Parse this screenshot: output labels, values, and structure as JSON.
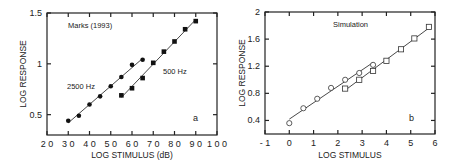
{
  "chart_data": [
    {
      "type": "scatter",
      "panel_label": "a",
      "title": "",
      "annotation": "Marks (1993)",
      "xlabel": "LOG STIMULUS (dB)",
      "ylabel": "LOG RESPONSE",
      "xlim": [
        20,
        100
      ],
      "ylim": [
        0.3,
        1.5
      ],
      "xticks": [
        20,
        30,
        40,
        50,
        60,
        70,
        80,
        90,
        100
      ],
      "yticks": [
        0.5,
        1,
        1.5
      ],
      "ytick_labels": [
        "0.5",
        "1",
        "1.5"
      ],
      "grid": false,
      "series": [
        {
          "name": "2500 Hz",
          "marker": "filled-circle",
          "fit_line": true,
          "x": [
            30,
            35,
            40,
            45,
            50,
            55,
            60,
            65
          ],
          "y": [
            0.44,
            0.49,
            0.6,
            0.68,
            0.78,
            0.87,
            0.99,
            1.04
          ]
        },
        {
          "name": "500 Hz",
          "marker": "filled-square",
          "fit_line": true,
          "x": [
            55,
            60,
            65,
            70,
            75,
            80,
            85,
            90
          ],
          "y": [
            0.69,
            0.76,
            0.86,
            1.01,
            1.12,
            1.22,
            1.34,
            1.42
          ]
        }
      ]
    },
    {
      "type": "scatter",
      "panel_label": "b",
      "title": "",
      "annotation": "Simulation",
      "xlabel": "LOG STIMULUS",
      "ylabel": "LOG RESPONSE",
      "xlim": [
        -1,
        6
      ],
      "ylim": [
        0.2,
        2
      ],
      "xticks": [
        -1,
        0,
        1,
        2,
        3,
        4,
        5,
        6
      ],
      "xtick_labels": [
        "- 1",
        "0",
        "1",
        "2",
        "3",
        "4",
        "5",
        "6"
      ],
      "yticks": [
        0.4,
        0.8,
        1.2,
        1.6,
        2
      ],
      "ytick_labels": [
        "0.4",
        "0.8",
        "1.2",
        "1.6",
        "2"
      ],
      "grid": false,
      "series": [
        {
          "name": "circles",
          "marker": "open-circle",
          "fit_line": true,
          "x": [
            0,
            0.58,
            1.15,
            1.72,
            2.3,
            2.88,
            3.45
          ],
          "y": [
            0.36,
            0.58,
            0.72,
            0.88,
            1.0,
            1.1,
            1.22
          ]
        },
        {
          "name": "squares",
          "marker": "open-square",
          "fit_line": true,
          "x": [
            2.3,
            2.88,
            3.45,
            4.0,
            4.6,
            5.15,
            5.75
          ],
          "y": [
            0.87,
            1.0,
            1.13,
            1.28,
            1.45,
            1.61,
            1.78
          ]
        }
      ]
    }
  ]
}
